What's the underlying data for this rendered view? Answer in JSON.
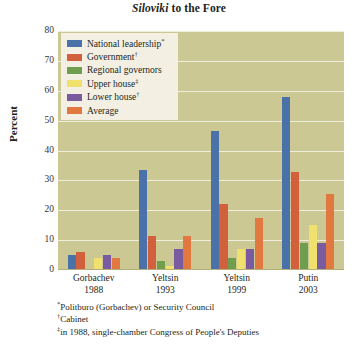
{
  "chart_data": {
    "type": "bar",
    "title": "Siloviki to the Fore",
    "title_italic_word": "Siloviki",
    "title_rest": " to the Fore",
    "xlabel": "",
    "ylabel": "Percent",
    "ylim": [
      0,
      80
    ],
    "yticks": [
      0,
      10,
      20,
      30,
      40,
      50,
      60,
      70,
      80
    ],
    "grid": true,
    "legend_position": "top-left",
    "categories": [
      "Gorbachev 1988",
      "Yeltsin 1993",
      "Yeltsin 1999",
      "Putin 2003"
    ],
    "category_names": [
      "Gorbachev",
      "Yeltsin",
      "Yeltsin",
      "Putin"
    ],
    "category_years": [
      "1988",
      "1993",
      "1999",
      "2003"
    ],
    "series": [
      {
        "name": "National leadership",
        "footnote_marker": "*",
        "color": "#4a72a8",
        "values": [
          5.0,
          33.5,
          46.5,
          58.0
        ]
      },
      {
        "name": "Government",
        "footnote_marker": "†",
        "color": "#d2603c",
        "values": [
          6.0,
          11.5,
          22.0,
          32.8
        ]
      },
      {
        "name": "Regional governors",
        "footnote_marker": "",
        "color": "#6f9f4e",
        "values": [
          0.5,
          3.0,
          4.0,
          9.0
        ]
      },
      {
        "name": "Upper house",
        "footnote_marker": "‡",
        "color": "#f0e06e",
        "values": [
          4.0,
          1.5,
          7.0,
          15.0
        ]
      },
      {
        "name": "Lower house",
        "footnote_marker": "†",
        "color": "#7a5ba0",
        "values": [
          5.0,
          7.0,
          7.0,
          9.0
        ]
      },
      {
        "name": "Average",
        "footnote_marker": "",
        "color": "#e07840",
        "values": [
          4.0,
          11.5,
          17.5,
          25.5
        ]
      }
    ]
  },
  "footnotes": [
    {
      "marker": "*",
      "text": "Politburo (Gorbachev) or Security Council"
    },
    {
      "marker": "†",
      "text": "Cabinet"
    },
    {
      "marker": "‡",
      "text": "in 1988, single-chamber Congress of People's Deputies"
    }
  ],
  "colors": {
    "plot_background": "#cbc894",
    "legend_background": "#f3f0e3",
    "gridline": "#efeddc",
    "page_background": "#ffffff",
    "text": "#231f20"
  }
}
